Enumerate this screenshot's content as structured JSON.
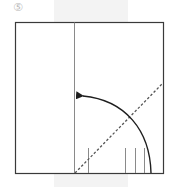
{
  "diagram": {
    "type": "origami-fold-step",
    "step_label": "⑤",
    "colors": {
      "paper_border": "#3a3a3a",
      "crease_line": "#8a8a8a",
      "fold_arrow": "#1e1e1e",
      "valley_fold_line": "#555555",
      "background_band": "#f3f3f3"
    },
    "elements": {
      "square": {
        "x": 15,
        "y": 22,
        "width": 148,
        "height": 151
      },
      "center_crease": {
        "x": 74,
        "y1": 22,
        "y2": 173
      },
      "valley_fold": {
        "x1": 74,
        "y1": 173,
        "x2": 162,
        "y2": 84
      },
      "fold_arrow": {
        "from": [
          151,
          173
        ],
        "to": [
          76,
          96
        ]
      },
      "tick_marks": [
        {
          "x": 88,
          "y1": 148,
          "y2": 173
        },
        {
          "x": 125,
          "y1": 148,
          "y2": 173
        },
        {
          "x": 135,
          "y1": 148,
          "y2": 173
        },
        {
          "x": 144,
          "y1": 148,
          "y2": 173
        }
      ]
    }
  }
}
